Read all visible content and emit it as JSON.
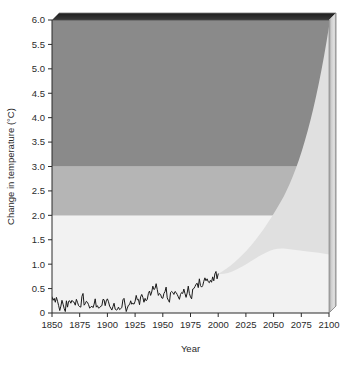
{
  "chart_data": {
    "type": "area",
    "title": "",
    "subtitle": "",
    "xlabel": "Year",
    "ylabel": "Change in temperature (°C)",
    "xlim": [
      1850,
      2100
    ],
    "ylim": [
      0,
      6.0
    ],
    "grid": false,
    "legend": "none",
    "x_ticks": [
      1850,
      1875,
      1900,
      1925,
      1950,
      1975,
      2000,
      2025,
      2050,
      2075,
      2100
    ],
    "x_tick_labels": [
      "1850",
      "1875",
      "1900",
      "1925",
      "1950",
      "1975",
      "2000",
      "2025",
      "2050",
      "2075",
      "2100"
    ],
    "y_ticks": [
      0,
      0.5,
      1.0,
      1.5,
      2.0,
      2.5,
      3.0,
      3.5,
      4.0,
      4.5,
      5.0,
      5.5,
      6.0
    ],
    "y_tick_labels": [
      "0",
      "0.5",
      "1.0",
      "1.5",
      "2.0",
      "2.5",
      "3.0",
      "3.5",
      "4.0",
      "4.5",
      "5.0",
      "5.5",
      "6.0"
    ],
    "bands": [
      {
        "name": "low-risk-band",
        "from": 0.0,
        "to": 2.0,
        "color": "#fbfbfb"
      },
      {
        "name": "medium-risk-band",
        "from": 2.0,
        "to": 3.0,
        "color": "#b5b5b5"
      },
      {
        "name": "high-risk-band",
        "from": 3.0,
        "to": 6.0,
        "color": "#8a8a8a"
      },
      {
        "name": "faint-lower-band",
        "from": 0.0,
        "to": 1.0,
        "color": "#f2f2f2"
      }
    ],
    "projection_wedge": {
      "name": "projection-uncertainty-wedge",
      "color": "#e0e0e0",
      "start_year": 2000,
      "start_value": 0.8,
      "upper_2100": 5.8,
      "lower_2100": 1.2,
      "upper_bound": [
        {
          "year": 2000,
          "value": 0.8
        },
        {
          "year": 2020,
          "value": 1.35
        },
        {
          "year": 2040,
          "value": 2.2
        },
        {
          "year": 2060,
          "value": 3.15
        },
        {
          "year": 2080,
          "value": 4.4
        },
        {
          "year": 2100,
          "value": 5.8
        }
      ],
      "lower_bound": [
        {
          "year": 2000,
          "value": 0.8
        },
        {
          "year": 2020,
          "value": 0.9
        },
        {
          "year": 2040,
          "value": 1.0
        },
        {
          "year": 2060,
          "value": 1.08
        },
        {
          "year": 2080,
          "value": 1.15
        },
        {
          "year": 2100,
          "value": 1.2
        }
      ]
    },
    "series": [
      {
        "name": "observed-temperature-anomaly",
        "color": "#1a1a1a",
        "x": [
          1850,
          1851,
          1852,
          1853,
          1854,
          1855,
          1856,
          1857,
          1858,
          1859,
          1860,
          1861,
          1862,
          1863,
          1864,
          1865,
          1866,
          1867,
          1868,
          1869,
          1870,
          1871,
          1872,
          1873,
          1874,
          1875,
          1876,
          1877,
          1878,
          1879,
          1880,
          1881,
          1882,
          1883,
          1884,
          1885,
          1886,
          1887,
          1888,
          1889,
          1890,
          1891,
          1892,
          1893,
          1894,
          1895,
          1896,
          1897,
          1898,
          1899,
          1900,
          1901,
          1902,
          1903,
          1904,
          1905,
          1906,
          1907,
          1908,
          1909,
          1910,
          1911,
          1912,
          1913,
          1914,
          1915,
          1916,
          1917,
          1918,
          1919,
          1920,
          1921,
          1922,
          1923,
          1924,
          1925,
          1926,
          1927,
          1928,
          1929,
          1930,
          1931,
          1932,
          1933,
          1934,
          1935,
          1936,
          1937,
          1938,
          1939,
          1940,
          1941,
          1942,
          1943,
          1944,
          1945,
          1946,
          1947,
          1948,
          1949,
          1950,
          1951,
          1952,
          1953,
          1954,
          1955,
          1956,
          1957,
          1958,
          1959,
          1960,
          1961,
          1962,
          1963,
          1964,
          1965,
          1966,
          1967,
          1968,
          1969,
          1970,
          1971,
          1972,
          1973,
          1974,
          1975,
          1976,
          1977,
          1978,
          1979,
          1980,
          1981,
          1982,
          1983,
          1984,
          1985,
          1986,
          1987,
          1988,
          1989,
          1990,
          1991,
          1992,
          1993,
          1994,
          1995,
          1996,
          1997,
          1998,
          1999,
          2000
        ],
        "values": [
          0.33,
          0.26,
          0.3,
          0.22,
          0.32,
          0.24,
          0.15,
          0.05,
          0.14,
          0.26,
          0.18,
          0.09,
          0.03,
          0.25,
          0.12,
          0.24,
          0.25,
          0.2,
          0.26,
          0.23,
          0.22,
          0.16,
          0.28,
          0.22,
          0.15,
          0.13,
          0.12,
          0.34,
          0.4,
          0.16,
          0.19,
          0.24,
          0.22,
          0.17,
          0.1,
          0.12,
          0.14,
          0.11,
          0.18,
          0.29,
          0.12,
          0.15,
          0.1,
          0.11,
          0.14,
          0.15,
          0.28,
          0.27,
          0.15,
          0.25,
          0.29,
          0.23,
          0.14,
          0.1,
          0.06,
          0.13,
          0.2,
          0.08,
          0.06,
          0.07,
          0.12,
          0.07,
          0.09,
          0.11,
          0.27,
          0.3,
          0.16,
          0.03,
          0.1,
          0.16,
          0.17,
          0.25,
          0.18,
          0.2,
          0.18,
          0.24,
          0.36,
          0.27,
          0.28,
          0.17,
          0.33,
          0.38,
          0.32,
          0.22,
          0.3,
          0.25,
          0.28,
          0.4,
          0.45,
          0.36,
          0.43,
          0.55,
          0.48,
          0.5,
          0.6,
          0.48,
          0.36,
          0.4,
          0.38,
          0.31,
          0.3,
          0.4,
          0.44,
          0.53,
          0.31,
          0.26,
          0.22,
          0.42,
          0.44,
          0.42,
          0.38,
          0.44,
          0.42,
          0.38,
          0.33,
          0.28,
          0.38,
          0.42,
          0.4,
          0.49,
          0.4,
          0.32,
          0.41,
          0.55,
          0.4,
          0.33,
          0.29,
          0.49,
          0.5,
          0.54,
          0.59,
          0.61,
          0.52,
          0.7,
          0.56,
          0.53,
          0.56,
          0.65,
          0.72,
          0.66,
          0.7,
          0.64,
          0.62,
          0.67,
          0.63,
          0.74,
          0.66,
          0.8,
          0.85,
          0.7,
          0.8
        ]
      }
    ],
    "annotations": []
  },
  "colors": {
    "high_band": "#8a8a8a",
    "medium_band": "#b5b5b5",
    "low_band": "#fbfbfb",
    "faint_band": "#f2f2f2",
    "wedge": "#e0e0e0",
    "line": "#1a1a1a",
    "text": "#2b2b2b",
    "bevel_top": "#2e2e2e",
    "bevel_side_light": "#d8d8d8",
    "bevel_side_dark": "#9a9a9a",
    "frame": "#6f6f6f"
  }
}
